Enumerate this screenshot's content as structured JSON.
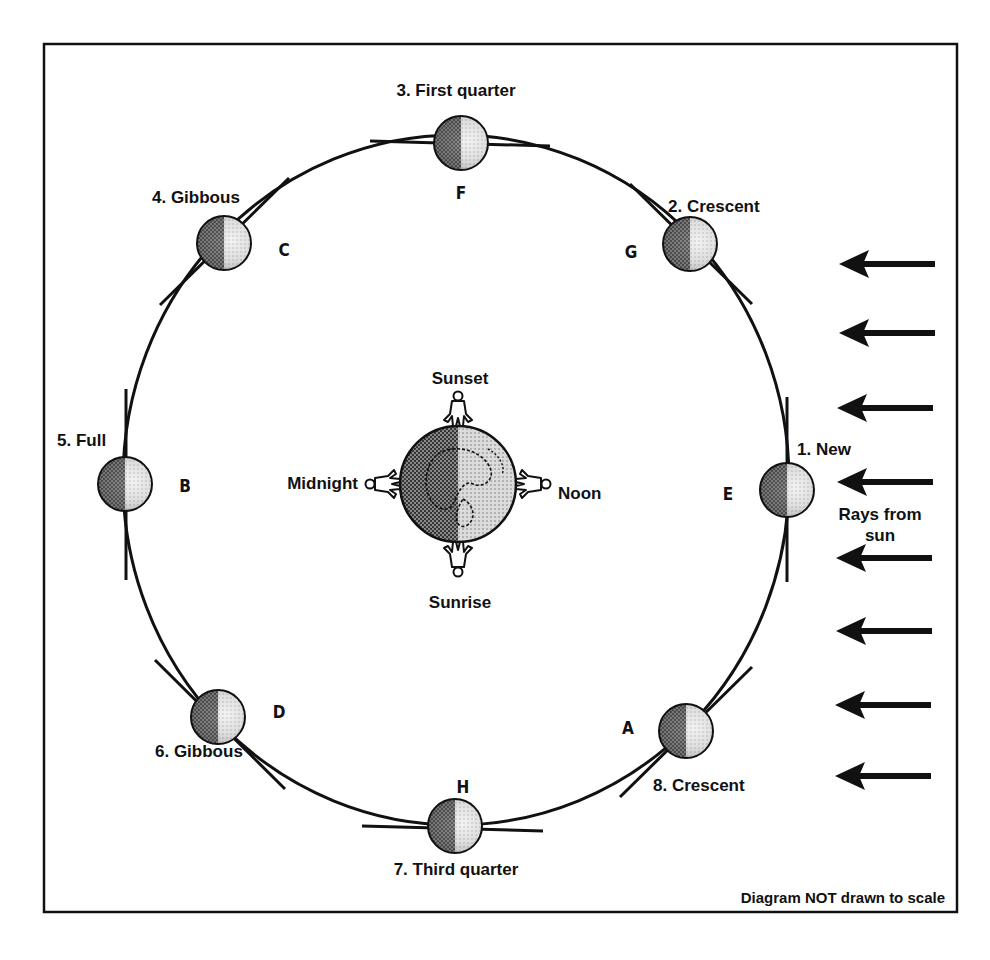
{
  "diagram": {
    "note": "Diagram NOT drawn to scale",
    "sun_label_line1": "Rays from",
    "sun_label_line2": "sun",
    "earth": {
      "times": {
        "top": "Sunset",
        "bottom": "Sunrise",
        "left": "Midnight",
        "right": "Noon"
      }
    },
    "moons": [
      {
        "number": "1",
        "phase": "1. New",
        "letter": "E"
      },
      {
        "number": "2",
        "phase": "2. Crescent",
        "letter": "G"
      },
      {
        "number": "3",
        "phase": "3. First quarter",
        "letter": "F"
      },
      {
        "number": "4",
        "phase": "4. Gibbous",
        "letter": "C"
      },
      {
        "number": "5",
        "phase": "5. Full",
        "letter": "B"
      },
      {
        "number": "6",
        "phase": "6. Gibbous",
        "letter": "D"
      },
      {
        "number": "7",
        "phase": "7. Third quarter",
        "letter": "H"
      },
      {
        "number": "8",
        "phase": "8. Crescent",
        "letter": "A"
      }
    ],
    "sun_ray_count": 8,
    "colors": {
      "ink": "#111111",
      "moon_dark": "#6a6a6a",
      "moon_light": "#d8d8d8",
      "background": "#ffffff"
    }
  }
}
